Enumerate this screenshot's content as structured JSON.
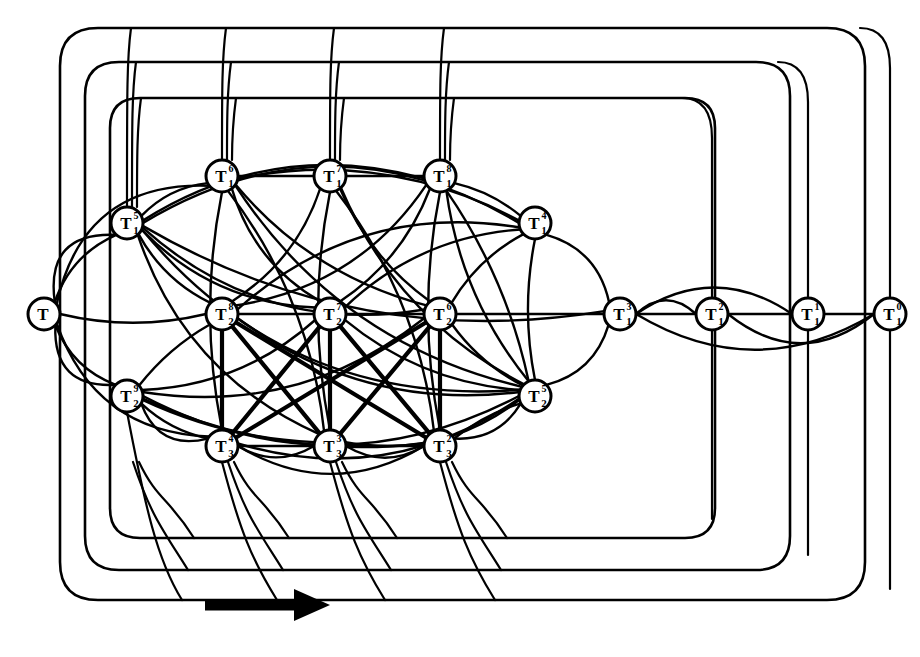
{
  "figure": {
    "background_color": "#ffffff",
    "ink_color": "#000000",
    "node_fill": "#ffffff",
    "node_radius": 16,
    "arrow": {
      "name": "direction-arrow",
      "label": "",
      "x1": 205,
      "y1": 605,
      "x2": 320,
      "y2": 605,
      "color": "#000000",
      "thickness": 11
    },
    "wrap_loops": [
      {
        "name": "outer-loop",
        "left": 60,
        "top": 28,
        "right": 865,
        "bottom": 600,
        "radius": 38
      },
      {
        "name": "middle-loop",
        "left": 85,
        "top": 62,
        "right": 790,
        "bottom": 570,
        "radius": 34
      },
      {
        "name": "inner-loop",
        "left": 110,
        "top": 98,
        "right": 715,
        "bottom": 538,
        "radius": 30
      }
    ],
    "nodes": [
      {
        "id": "n0",
        "name": "node-T-root",
        "base": "T",
        "sub": "",
        "sup": "",
        "x": 44,
        "y": 314
      },
      {
        "id": "n1",
        "name": "node-T1-a",
        "base": "T",
        "sub": "1",
        "sup": "5",
        "x": 127,
        "y": 223
      },
      {
        "id": "n2",
        "name": "node-T1-b",
        "base": "T",
        "sub": "1",
        "sup": "6",
        "x": 222,
        "y": 176
      },
      {
        "id": "n3",
        "name": "node-T1-c",
        "base": "T",
        "sub": "1",
        "sup": "7",
        "x": 330,
        "y": 176
      },
      {
        "id": "n4",
        "name": "node-T1-d",
        "base": "T",
        "sub": "1",
        "sup": "8",
        "x": 440,
        "y": 176
      },
      {
        "id": "n5",
        "name": "node-T1-e",
        "base": "T",
        "sub": "1",
        "sup": "4",
        "x": 535,
        "y": 223
      },
      {
        "id": "n6",
        "name": "node-T1-f",
        "base": "T",
        "sub": "1",
        "sup": "3",
        "x": 620,
        "y": 314
      },
      {
        "id": "n7",
        "name": "node-T1-g",
        "base": "T",
        "sub": "1",
        "sup": "2",
        "x": 712,
        "y": 314
      },
      {
        "id": "n8",
        "name": "node-T1-h",
        "base": "T",
        "sub": "1",
        "sup": "1",
        "x": 808,
        "y": 314
      },
      {
        "id": "n9",
        "name": "node-T1-i",
        "base": "T",
        "sub": "1",
        "sup": "0",
        "x": 890,
        "y": 314
      },
      {
        "id": "n10",
        "name": "node-T2-a",
        "base": "T",
        "sub": "2",
        "sup": "9",
        "x": 127,
        "y": 396
      },
      {
        "id": "n11",
        "name": "node-T2-b",
        "base": "T",
        "sub": "2",
        "sup": "8",
        "x": 222,
        "y": 314
      },
      {
        "id": "n12",
        "name": "node-T2-c",
        "base": "T",
        "sub": "2",
        "sup": "7",
        "x": 330,
        "y": 314
      },
      {
        "id": "n13",
        "name": "node-T2-d",
        "base": "T",
        "sub": "2",
        "sup": "6",
        "x": 440,
        "y": 314
      },
      {
        "id": "n14",
        "name": "node-T2-e",
        "base": "T",
        "sub": "2",
        "sup": "5",
        "x": 535,
        "y": 396
      },
      {
        "id": "n15",
        "name": "node-T3-a",
        "base": "T",
        "sub": "3",
        "sup": "4",
        "x": 222,
        "y": 446
      },
      {
        "id": "n16",
        "name": "node-T3-b",
        "base": "T",
        "sub": "3",
        "sup": "3",
        "x": 330,
        "y": 446
      },
      {
        "id": "n17",
        "name": "node-T3-c",
        "base": "T",
        "sub": "3",
        "sup": "2",
        "x": 440,
        "y": 446
      }
    ],
    "node_labels": [
      "T",
      "T₁⁵",
      "T₁⁶",
      "T₁⁷",
      "T₁⁸",
      "T₁⁴",
      "T₁³",
      "T₁²",
      "T₁¹",
      "T₁⁰",
      "T₂⁹",
      "T₂⁸",
      "T₂⁷",
      "T₂⁶",
      "T₂⁵",
      "T₃⁴",
      "T₃³",
      "T₃²"
    ]
  }
}
